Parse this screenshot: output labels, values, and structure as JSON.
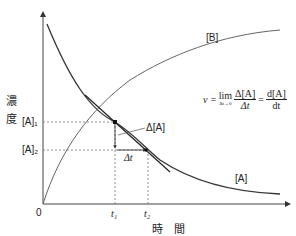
{
  "diagram": {
    "y_axis_label_chars": [
      "濃",
      "度"
    ],
    "x_axis_label": "時　間",
    "origin_label": "0",
    "curves": {
      "reactant": "[A]",
      "product": "[B]"
    },
    "y_ticks": {
      "a1": "[A]₁",
      "a2": "[A]₂"
    },
    "x_ticks": {
      "t1": "t₁",
      "t2": "t₂"
    },
    "annotations": {
      "delta_a": "Δ[A]",
      "delta_t": "Δt"
    },
    "formula": {
      "v": "v =",
      "lim": "lim",
      "lim_sub": "Δt→0",
      "frac1_num": "Δ[A]",
      "frac1_den": "Δt",
      "eq": "=",
      "frac2_num": "d[A]",
      "frac2_den": "dt"
    },
    "colors": {
      "line": "#333333",
      "dotted": "#777777"
    }
  }
}
